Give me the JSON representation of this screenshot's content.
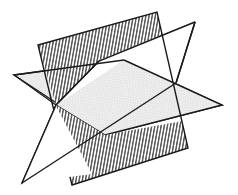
{
  "figure": {
    "kind": "geometric-diagram",
    "background_color": "#ffffff",
    "stroke_color": "#1a1a1a",
    "canvas": {
      "width": 238,
      "height": 195
    }
  },
  "geometry": {
    "common_point": {
      "label": "intersection point",
      "x": 56,
      "y": 105
    },
    "planes": [
      {
        "id": "stippled-plane",
        "name": "horizontal stippled plane",
        "fill_style": "stipple",
        "fill_color": "#f2f2f2",
        "texture_color": "#b5b5b5",
        "stroke_color": "#1a1a1a",
        "stroke_width": 1.3,
        "points": "14,75 124,60 222,105 105,135"
      },
      {
        "id": "white-plane",
        "name": "unfilled white plane",
        "fill_style": "none",
        "fill_color": "#ffffff",
        "stroke_color": "#1a1a1a",
        "stroke_width": 1.3,
        "points": "56,105 99,61 195,22 176,83 22,183"
      },
      {
        "id": "hatched-plane",
        "name": "vertical hatched plane",
        "fill_style": "hatch",
        "fill_color": "#ffffff",
        "texture_color": "#1a1a1a",
        "stroke_color": "#1a1a1a",
        "stroke_width": 1.3,
        "hatch_angle_deg": 80,
        "hatch_spacing_px": 3.1,
        "points": "38,45 157,12 188,148 72,185"
      }
    ],
    "edges": [
      {
        "id": "white-upper-fold",
        "from": [
          56,
          105
        ],
        "to": [
          99,
          61
        ],
        "name": "upper fold crease"
      },
      {
        "id": "white-right-fold",
        "from": [
          195,
          22
        ],
        "to": [
          176,
          83
        ],
        "name": "right fold crease"
      },
      {
        "id": "white-lower-leg",
        "from": [
          56,
          105
        ],
        "to": [
          22,
          183
        ],
        "name": "lower left leg"
      },
      {
        "id": "white-bottom-edge",
        "from": [
          22,
          183
        ],
        "to": [
          176,
          83
        ],
        "name": "lower right edge"
      }
    ]
  },
  "labels": {
    "annotations": []
  }
}
